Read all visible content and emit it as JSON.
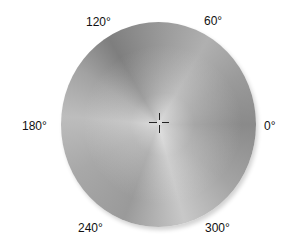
{
  "hue_wheel": {
    "labels": {
      "deg0": "0°",
      "deg60": "60°",
      "deg120": "120°",
      "deg180": "180°",
      "deg240": "240°",
      "deg300": "300°"
    },
    "crosshair_position": "center"
  }
}
